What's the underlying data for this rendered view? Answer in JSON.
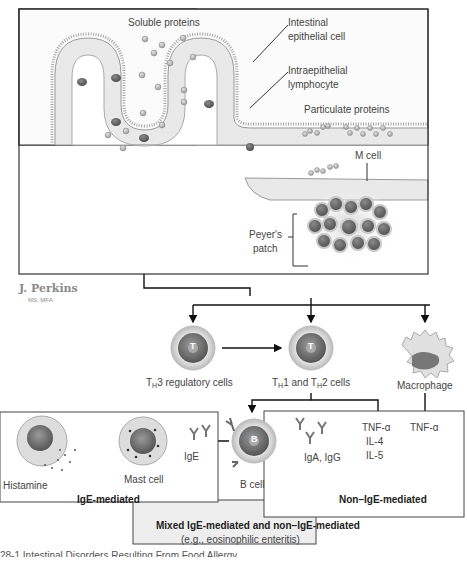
{
  "figure": {
    "labels": {
      "soluble_proteins": "Soluble proteins",
      "intestinal_epithelial_cell": "Intestinal epithelial cell",
      "intestinal_epithelial_cell_l1": "Intestinal",
      "intestinal_epithelial_cell_l2": "epithelial cell",
      "intraepithelial_lymphocyte_l1": "Intraepithelial",
      "intraepithelial_lymphocyte_l2": "lymphocyte",
      "particulate_proteins": "Particulate proteins",
      "m_cell": "M cell",
      "peyers_patch_l1": "Peyer's",
      "peyers_patch_l2": "patch"
    },
    "signature": {
      "name": "J. Perkins",
      "credentials": "MS, MFA"
    },
    "cells": {
      "th3_prefix": "T",
      "th3_sub": "H",
      "th3_rest": "3 regulatory cells",
      "th12_a": "T",
      "th12_sub1": "H",
      "th12_b": "1 and T",
      "th12_sub2": "H",
      "th12_c": "2 cells",
      "macrophage": "Macrophage",
      "t_glyph": "T",
      "b_glyph": "B",
      "b_cell": "B cell",
      "mast_cell": "Mast cell",
      "histamine": "Histamine",
      "ige": "IgE",
      "iga_igg": "IgA, IgG"
    },
    "cytokines": {
      "th_col": [
        "TNF-α",
        "IL-4",
        "IL-5"
      ],
      "macrophage_col": "TNF-α"
    },
    "boxes": {
      "ige_mediated": "IgE-mediated",
      "non_ige_mediated": "Non–IgE-mediated",
      "mixed_title": "Mixed IgE-mediated and non–IgE-mediated",
      "mixed_example": "(e.g., eosinophilic enteritis)"
    },
    "caption": "28-1 Intestinal Disorders Resulting From Food Allergy"
  }
}
